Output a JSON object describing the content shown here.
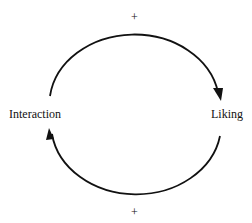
{
  "diagram": {
    "type": "causal-loop",
    "nodes": {
      "left": {
        "label": "Interaction"
      },
      "right": {
        "label": "Liking"
      }
    },
    "edges": {
      "top": {
        "from": "Interaction",
        "to": "Liking",
        "sign": "+"
      },
      "bottom": {
        "from": "Liking",
        "to": "Interaction",
        "sign": "+"
      }
    },
    "colors": {
      "stroke": "#111111",
      "background": "#ffffff"
    }
  }
}
